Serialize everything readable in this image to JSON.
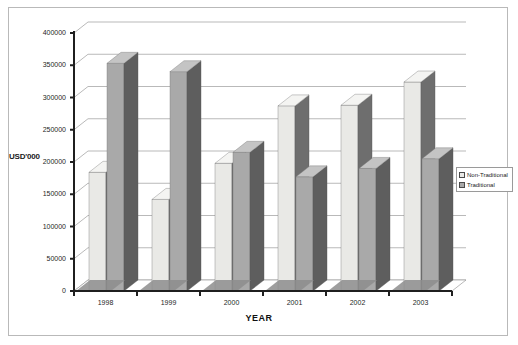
{
  "chart_data": {
    "type": "bar",
    "title": "",
    "xlabel": "YEAR",
    "ylabel": "USD'000",
    "categories": [
      "1998",
      "1999",
      "2000",
      "2001",
      "2002",
      "2003"
    ],
    "series": [
      {
        "name": "Non-Traditional",
        "values": [
          184000,
          142000,
          198000,
          287000,
          288000,
          324000
        ],
        "color": "#e9e9e6"
      },
      {
        "name": "Traditional",
        "values": [
          353000,
          340000,
          215000,
          177000,
          190000,
          205000
        ],
        "color": "#a9a9a9"
      }
    ],
    "ylim": [
      0,
      400000
    ],
    "yticks": [
      "0",
      "50000",
      "100000",
      "150000",
      "200000",
      "250000",
      "300000",
      "350000",
      "400000"
    ],
    "ytick_values": [
      0,
      50000,
      100000,
      150000,
      200000,
      250000,
      300000,
      350000,
      400000
    ],
    "grid": true,
    "legend_position": "right",
    "style": "3d-clustered-column"
  },
  "legend": {
    "items": [
      {
        "label": "Non-Traditional"
      },
      {
        "label": "Traditional"
      }
    ]
  },
  "colors": {
    "bar_light_face": "#e9e9e6",
    "bar_light_top": "#f4f4f2",
    "bar_light_side": "#6e6e6e",
    "bar_dark_face": "#a9a9a9",
    "bar_dark_top": "#c4c4c4",
    "bar_dark_side": "#5e5e5e",
    "grid": "#9b9b9b",
    "axis": "#1f1f1f",
    "floor": "#8d8d8d",
    "frame": "#b9b9b9"
  }
}
